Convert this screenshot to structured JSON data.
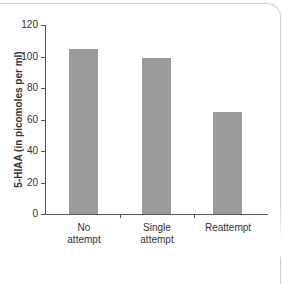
{
  "chart_data": {
    "type": "bar",
    "title": "",
    "categories": [
      "No attempt",
      "Single attempt",
      "Reattempt"
    ],
    "category_lines": [
      [
        "No",
        "attempt"
      ],
      [
        "Single",
        "attempt"
      ],
      [
        "Reattempt",
        ""
      ]
    ],
    "values": [
      105,
      99,
      65
    ],
    "xlabel": "",
    "ylabel": "5-HIAA (in picomoles per ml)",
    "ylim": [
      0,
      120
    ],
    "yticks": [
      0,
      20,
      40,
      60,
      80,
      100,
      120
    ],
    "grid": false,
    "legend": null,
    "bar_color": "#9a9a9a"
  }
}
